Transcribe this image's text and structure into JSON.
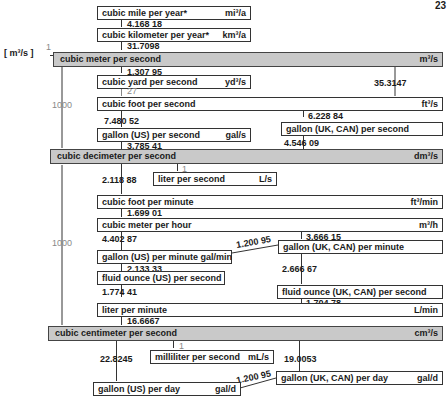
{
  "page": {
    "number": "23"
  },
  "base": {
    "unit": "m³/s",
    "factor": "1"
  },
  "boxes": {
    "mi3a": {
      "label": "cubic mile per year*",
      "unit": "mi³/a"
    },
    "km3a": {
      "label": "cubic kilometer per year*",
      "unit": "km³/a"
    },
    "m3s": {
      "label": "cubic meter per second",
      "unit": "m³/s"
    },
    "yd3s": {
      "label": "cubic yard per second",
      "unit": "yd³/s"
    },
    "ft3s": {
      "label": "cubic foot per second",
      "unit": "ft³/s"
    },
    "galUSs": {
      "label": "gallon (US) per second",
      "unit": "gal/s"
    },
    "galUKs": {
      "label": "gallon (UK, CAN) per second",
      "unit": ""
    },
    "dm3s": {
      "label": "cubic decimeter per second",
      "unit": "dm³/s"
    },
    "Ls": {
      "label": "liter per second",
      "unit": "L/s"
    },
    "ft3min": {
      "label": "cubic foot per minute",
      "unit": "ft³/min"
    },
    "m3h": {
      "label": "cubic meter per hour",
      "unit": "m³/h"
    },
    "galUSmin": {
      "label": "gallon (US) per minute gal/min",
      "unit": ""
    },
    "galUKmin": {
      "label": "gallon (UK, CAN) per minute",
      "unit": ""
    },
    "flozUSs": {
      "label": "fluid ounce (US) per second",
      "unit": ""
    },
    "flozUKs": {
      "label": "fluid ounce (UK, CAN) per second",
      "unit": ""
    },
    "Lmin": {
      "label": "liter per minute",
      "unit": "L/min"
    },
    "cm3s": {
      "label": "cubic centimeter per second",
      "unit": "cm³/s"
    },
    "mLs": {
      "label": "milliliter per second",
      "unit": "mL/s"
    },
    "galUSd": {
      "label": "gallon (US) per day",
      "unit": "gal/d"
    },
    "galUKd": {
      "label": "gallon (UK, CAN) per day",
      "unit": "gal/d"
    }
  },
  "factors": {
    "mi3a_km3a": "4.168 18",
    "km3a_m3s": "31.7098",
    "m3s_yd3s": "1.307 95",
    "yd3s_ft3s": "27",
    "m3s_ft3s": "35.3147",
    "m3s_dm3s": "1000",
    "ft3s_galUS": "7.480 52",
    "ft3s_galUK": "6.228 84",
    "galUS_dm3s": "3.785 41",
    "galUK_dm3s": "4.546 09",
    "dm3s_Ls": "1",
    "dm3s_ft3min": "2.118 88",
    "ft3min_m3h": "1.699 01",
    "m3h_galUSmin": "4.402 87",
    "m3h_galUKmin": "3.666 15",
    "galUKmin_galUSmin": "1.200 95",
    "galUSmin_flozUS": "2.133 33",
    "galUKmin_flozUK": "2.666 67",
    "flozUS_Lmin": "1.774 41",
    "flozUK_Lmin": "1.704 78",
    "dm3s_cm3s": "1000",
    "Lmin_cm3s": "16.6667",
    "cm3s_mLs": "1",
    "cm3s_galUSd": "22.8245",
    "cm3s_galUKd": "19.0053",
    "galUKd_galUSd": "1.200 95"
  }
}
